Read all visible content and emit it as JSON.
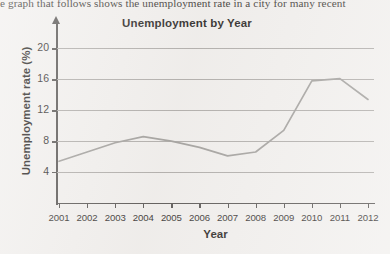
{
  "page": {
    "body_text": "e graph that follows shows the unemployment rate in a city for many recent",
    "x_axis_title": "Year",
    "y_axis_title": "Unemployment rate (%)"
  },
  "chart_data": {
    "type": "line",
    "title": "Unemployment by Year",
    "xlabel": "Year",
    "ylabel": "Unemployment rate (%)",
    "categories": [
      "2001",
      "2002",
      "2003",
      "2004",
      "2005",
      "2006",
      "2007",
      "2008",
      "2009",
      "2010",
      "2011",
      "2012"
    ],
    "values": [
      5.4,
      6.6,
      7.8,
      8.6,
      8.0,
      7.2,
      6.1,
      6.6,
      9.4,
      15.8,
      16.1,
      13.4
    ],
    "ylim": [
      0,
      22
    ],
    "ytick_values": [
      4,
      8,
      12,
      16,
      20
    ],
    "ytick_labels": [
      "4",
      "8",
      "12",
      "16",
      "20"
    ],
    "grid": true,
    "legend": "none",
    "line_color": "#9a9895",
    "grid_color": "#a9a6a3",
    "axis_color": "#4a4745",
    "background_color": "#f1efed"
  }
}
